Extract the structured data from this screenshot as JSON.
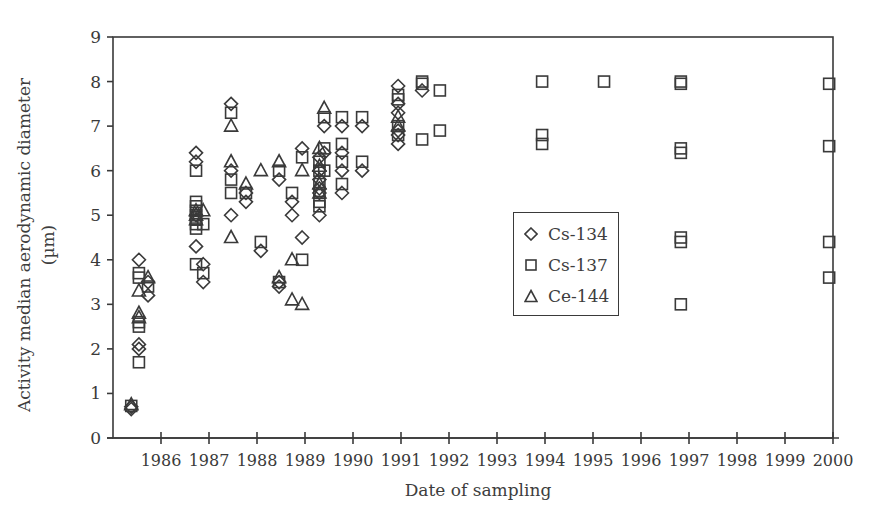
{
  "chart_data": {
    "type": "scatter",
    "title": "",
    "xlabel": "Date of sampling",
    "ylabel_line1": "Activity median aerodynamic diameter",
    "ylabel_line2": "(µm)",
    "xlim": [
      1985,
      2000
    ],
    "ylim": [
      0,
      9
    ],
    "x_ticks": [
      1986,
      1987,
      1988,
      1989,
      1990,
      1991,
      1992,
      1993,
      1994,
      1995,
      1996,
      1997,
      1998,
      1999,
      2000
    ],
    "x_tick_labels": [
      "1986",
      "1987",
      "1988",
      "1989",
      "1990",
      "1991",
      "1992",
      "1993",
      "1994",
      "1995",
      "1996",
      "1997",
      "1998",
      "1999",
      "2000"
    ],
    "y_ticks": [
      0,
      1,
      2,
      3,
      4,
      5,
      6,
      7,
      8,
      9
    ],
    "y_tick_labels": [
      "0",
      "1",
      "2",
      "3",
      "4",
      "5",
      "6",
      "7",
      "8",
      "9"
    ],
    "grid": false,
    "legend_position": "inside right-center",
    "series": [
      {
        "name": "Cs-134",
        "marker": "diamond",
        "points": [
          [
            1985.38,
            0.65
          ],
          [
            1985.38,
            0.7
          ],
          [
            1985.54,
            4.0
          ],
          [
            1985.54,
            2.1
          ],
          [
            1985.54,
            2.0
          ],
          [
            1985.73,
            3.2
          ],
          [
            1985.73,
            3.5
          ],
          [
            1986.73,
            6.4
          ],
          [
            1986.73,
            6.2
          ],
          [
            1986.73,
            5.0
          ],
          [
            1986.73,
            4.3
          ],
          [
            1986.88,
            3.9
          ],
          [
            1986.88,
            3.5
          ],
          [
            1987.46,
            7.5
          ],
          [
            1987.46,
            6.0
          ],
          [
            1987.46,
            5.0
          ],
          [
            1987.77,
            5.3
          ],
          [
            1987.77,
            5.5
          ],
          [
            1988.08,
            4.2
          ],
          [
            1988.46,
            5.8
          ],
          [
            1988.46,
            3.4
          ],
          [
            1988.46,
            3.5
          ],
          [
            1988.73,
            5.3
          ],
          [
            1988.73,
            5.0
          ],
          [
            1988.94,
            6.5
          ],
          [
            1988.94,
            4.5
          ],
          [
            1989.3,
            6.3
          ],
          [
            1989.3,
            6.0
          ],
          [
            1989.3,
            5.8
          ],
          [
            1989.3,
            5.6
          ],
          [
            1989.3,
            5.5
          ],
          [
            1989.3,
            5.0
          ],
          [
            1989.4,
            7.0
          ],
          [
            1989.4,
            6.4
          ],
          [
            1989.77,
            7.0
          ],
          [
            1989.77,
            6.4
          ],
          [
            1989.77,
            6.0
          ],
          [
            1989.77,
            5.5
          ],
          [
            1990.19,
            7.0
          ],
          [
            1990.19,
            6.0
          ],
          [
            1990.94,
            7.9
          ],
          [
            1990.94,
            7.5
          ],
          [
            1990.94,
            7.3
          ],
          [
            1990.94,
            6.9
          ],
          [
            1990.94,
            6.8
          ],
          [
            1990.94,
            6.6
          ],
          [
            1991.44,
            7.8
          ]
        ]
      },
      {
        "name": "Cs-137",
        "marker": "square",
        "points": [
          [
            1985.38,
            0.72
          ],
          [
            1985.54,
            3.7
          ],
          [
            1985.54,
            3.6
          ],
          [
            1985.54,
            2.6
          ],
          [
            1985.54,
            2.5
          ],
          [
            1985.54,
            1.7
          ],
          [
            1985.73,
            3.4
          ],
          [
            1986.73,
            6.0
          ],
          [
            1986.73,
            5.3
          ],
          [
            1986.73,
            5.2
          ],
          [
            1986.73,
            5.1
          ],
          [
            1986.73,
            5.0
          ],
          [
            1986.73,
            4.9
          ],
          [
            1986.73,
            4.8
          ],
          [
            1986.73,
            4.7
          ],
          [
            1986.73,
            3.9
          ],
          [
            1986.88,
            4.8
          ],
          [
            1986.88,
            3.7
          ],
          [
            1987.46,
            7.3
          ],
          [
            1987.46,
            5.8
          ],
          [
            1987.46,
            5.5
          ],
          [
            1987.77,
            5.5
          ],
          [
            1988.08,
            4.4
          ],
          [
            1988.46,
            6.0
          ],
          [
            1988.46,
            3.5
          ],
          [
            1988.73,
            5.5
          ],
          [
            1988.94,
            6.3
          ],
          [
            1988.94,
            4.0
          ],
          [
            1989.3,
            6.2
          ],
          [
            1989.3,
            6.0
          ],
          [
            1989.3,
            5.7
          ],
          [
            1989.3,
            5.5
          ],
          [
            1989.3,
            5.3
          ],
          [
            1989.3,
            5.2
          ],
          [
            1989.4,
            7.2
          ],
          [
            1989.4,
            6.5
          ],
          [
            1989.4,
            6.0
          ],
          [
            1989.77,
            7.2
          ],
          [
            1989.77,
            6.6
          ],
          [
            1989.77,
            6.2
          ],
          [
            1989.77,
            5.7
          ],
          [
            1990.19,
            7.2
          ],
          [
            1990.19,
            6.2
          ],
          [
            1990.94,
            7.7
          ],
          [
            1990.94,
            7.6
          ],
          [
            1990.94,
            7.0
          ],
          [
            1990.94,
            6.8
          ],
          [
            1991.44,
            8.0
          ],
          [
            1991.44,
            7.95
          ],
          [
            1991.44,
            6.7
          ],
          [
            1991.81,
            7.8
          ],
          [
            1991.81,
            6.9
          ],
          [
            1993.94,
            8.0
          ],
          [
            1993.94,
            6.8
          ],
          [
            1993.94,
            6.6
          ],
          [
            1995.23,
            8.0
          ],
          [
            1996.83,
            8.0
          ],
          [
            1996.83,
            7.95
          ],
          [
            1996.83,
            6.5
          ],
          [
            1996.83,
            6.4
          ],
          [
            1996.83,
            4.5
          ],
          [
            1996.83,
            4.4
          ],
          [
            1996.83,
            3.0
          ],
          [
            1999.92,
            7.95
          ],
          [
            1999.92,
            6.55
          ],
          [
            1999.92,
            4.4
          ],
          [
            1999.92,
            3.6
          ]
        ]
      },
      {
        "name": "Ce-144",
        "marker": "triangle",
        "points": [
          [
            1985.38,
            0.75
          ],
          [
            1985.54,
            3.3
          ],
          [
            1985.54,
            2.8
          ],
          [
            1985.54,
            2.7
          ],
          [
            1985.73,
            3.6
          ],
          [
            1986.73,
            5.1
          ],
          [
            1986.73,
            5.0
          ],
          [
            1986.73,
            4.9
          ],
          [
            1986.88,
            5.1
          ],
          [
            1987.46,
            7.0
          ],
          [
            1987.46,
            6.2
          ],
          [
            1987.46,
            4.5
          ],
          [
            1987.77,
            5.7
          ],
          [
            1988.08,
            6.0
          ],
          [
            1988.46,
            6.2
          ],
          [
            1988.46,
            3.6
          ],
          [
            1988.73,
            4.0
          ],
          [
            1988.73,
            3.1
          ],
          [
            1988.94,
            6.0
          ],
          [
            1988.94,
            3.0
          ],
          [
            1989.3,
            6.5
          ],
          [
            1989.3,
            6.1
          ],
          [
            1989.3,
            5.7
          ],
          [
            1989.3,
            5.5
          ],
          [
            1989.4,
            7.4
          ],
          [
            1990.94,
            7.2
          ],
          [
            1990.94,
            7.0
          ]
        ]
      }
    ]
  },
  "legend": {
    "items": [
      "Cs-134",
      "Cs-137",
      "Ce-144"
    ]
  },
  "colors": {
    "ink": "#3a3a3a",
    "background": "#ffffff"
  }
}
